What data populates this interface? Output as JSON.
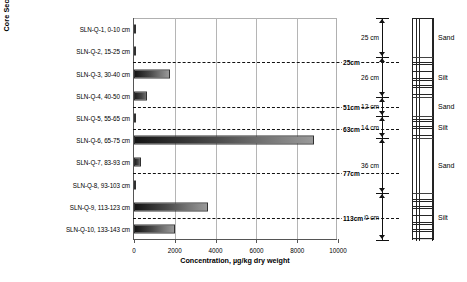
{
  "chart_data": {
    "type": "bar",
    "orientation": "horizontal",
    "title": "",
    "xlabel": "Concentration, µg/kg dry weight",
    "ylabel": "Core Section ID, depth (cm)",
    "xlim": [
      0,
      10000
    ],
    "xticks": [
      0,
      2000,
      4000,
      6000,
      8000,
      10000
    ],
    "xticklabels": [
      "0",
      "2000",
      "4000",
      "6000",
      "8000",
      "10000"
    ],
    "grid": true,
    "legend": "none",
    "categories": [
      "SLN-Q-1, 0-10 cm",
      "SLN-Q-2, 15-25 cm",
      "SLN-Q-3, 30-40 cm",
      "SLN-Q-4, 40-50 cm",
      "SLN-Q-5, 55-65 cm",
      "SLN-Q-6, 65-75 cm",
      "SLN-Q-7, 83-93 cm",
      "SLN-Q-8, 93-103 cm",
      "SLN-Q-9, 113-123 cm",
      "SLN-Q-10, 133-143 cm"
    ],
    "values": [
      90,
      110,
      1750,
      660,
      100,
      8800,
      330,
      60,
      3650,
      2000
    ],
    "annotations": [
      {
        "label": "25cm",
        "depth_cm": 25,
        "after_category_index": 1
      },
      {
        "label": "51cm",
        "depth_cm": 51,
        "after_category_index": 3
      },
      {
        "label": "63cm",
        "depth_cm": 63,
        "after_category_index": 4
      },
      {
        "label": "77cm",
        "depth_cm": 77,
        "after_category_index": 6
      },
      {
        "label": "113cm",
        "depth_cm": 113,
        "after_category_index": 8
      }
    ]
  },
  "lithology": {
    "layers": [
      {
        "name": "Sand",
        "thickness_label": "25 cm",
        "thickness_cm": 25,
        "pattern": "sand"
      },
      {
        "name": "Silt",
        "thickness_label": "26 cm",
        "thickness_cm": 26,
        "pattern": "silt"
      },
      {
        "name": "Sand",
        "thickness_label": "12 cm",
        "thickness_cm": 12,
        "pattern": "sand"
      },
      {
        "name": "Silt",
        "thickness_label": "14 cm",
        "thickness_cm": 14,
        "pattern": "silt"
      },
      {
        "name": "Sand",
        "thickness_label": "36 cm",
        "thickness_cm": 36,
        "pattern": "sand"
      },
      {
        "name": "Silt",
        "thickness_label": "30 cm",
        "thickness_cm": 30,
        "pattern": "silt"
      }
    ]
  }
}
